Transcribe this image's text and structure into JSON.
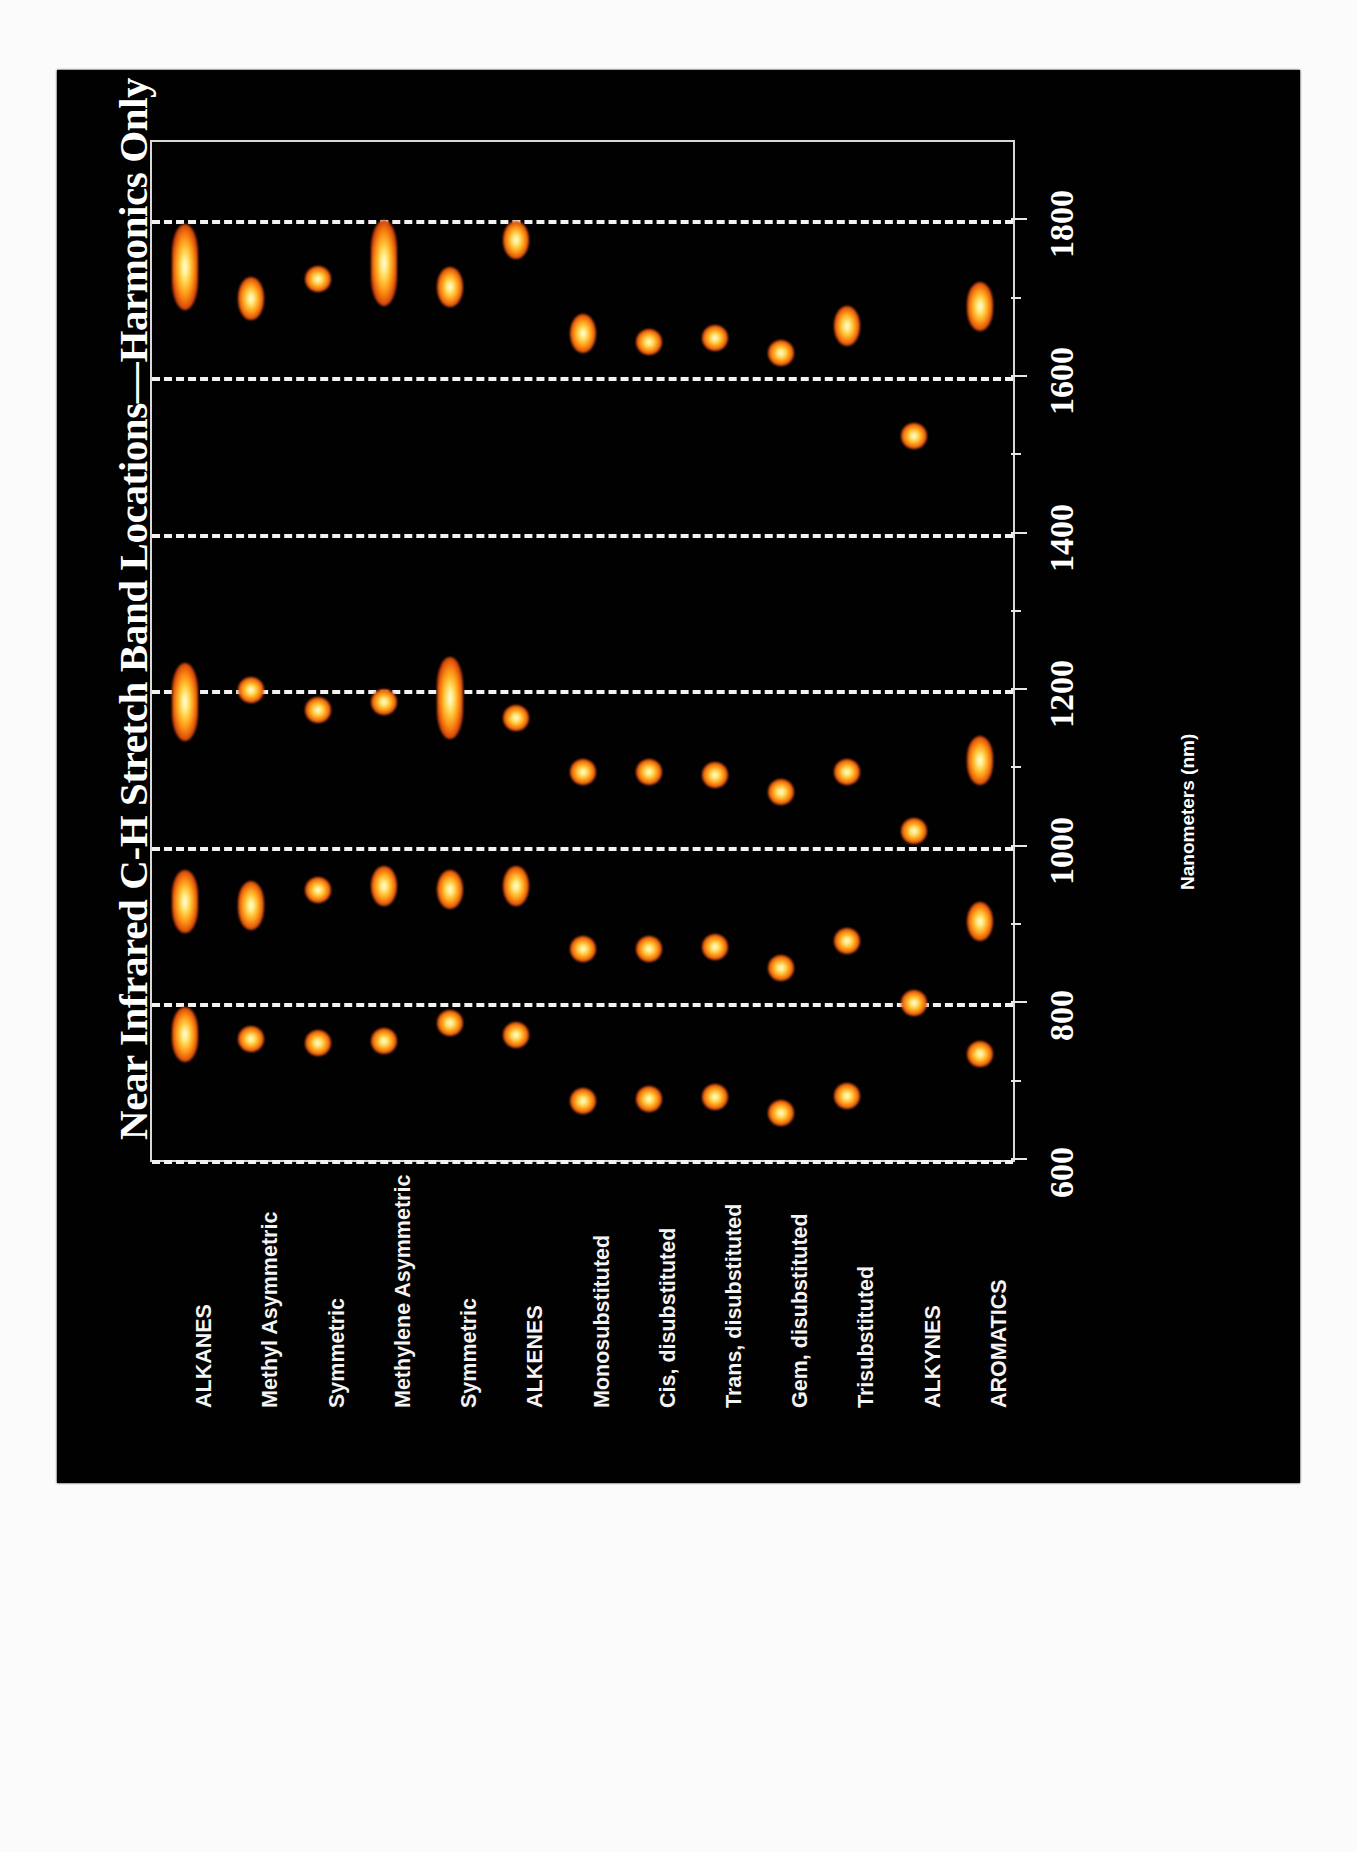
{
  "figure": {
    "title": "Near Infrared C-H Stretch Band Locations—Harmonics Only",
    "axis_title": "Nanometers (nm)",
    "background_color": "#000000",
    "spot_color": "#ff9b18",
    "grid_color": "#f2f2f2"
  },
  "chart_data": {
    "type": "scatter",
    "title": "Near Infrared C-H Stretch Band Locations—Harmonics Only",
    "xlabel": "Nanometers (nm)",
    "ylabel": "",
    "xlim": [
      600,
      1900
    ],
    "ticks": [
      600,
      800,
      1000,
      1200,
      1400,
      1600,
      1800
    ],
    "grid": true,
    "legend": "none",
    "orientation": "categories-vertical-axis-horizontal",
    "categories": [
      "ALKANES",
      "Methyl Asymmetric",
      "Symmetric",
      "Methylene Asymmetric",
      "Symmetric",
      "ALKENES",
      "Monosubstituted",
      "Cis, disubstituted",
      "Trans, disubstituted",
      "Gem, disubstituted",
      "Trisubstituted",
      "ALKYNES",
      "AROMATICS"
    ],
    "series": [
      {
        "name": "ALKANES",
        "bands": [
          {
            "center": 1740,
            "width": 110
          },
          {
            "center": 1185,
            "width": 100
          },
          {
            "center": 930,
            "width": 80
          },
          {
            "center": 760,
            "width": 70
          }
        ]
      },
      {
        "name": "Methyl Asymmetric",
        "bands": [
          {
            "center": 1700,
            "width": 55
          },
          {
            "center": 1200,
            "width": 30
          },
          {
            "center": 925,
            "width": 62
          },
          {
            "center": 755,
            "width": 30
          }
        ]
      },
      {
        "name": "Symmetric",
        "bands": [
          {
            "center": 1725,
            "width": 28
          },
          {
            "center": 1175,
            "width": 28
          },
          {
            "center": 945,
            "width": 30
          },
          {
            "center": 750,
            "width": 28
          }
        ]
      },
      {
        "name": "Methylene Asymmetric",
        "bands": [
          {
            "center": 1745,
            "width": 110
          },
          {
            "center": 1185,
            "width": 30
          },
          {
            "center": 950,
            "width": 52
          },
          {
            "center": 752,
            "width": 28
          }
        ]
      },
      {
        "name": "Symmetric",
        "bands": [
          {
            "center": 1715,
            "width": 52
          },
          {
            "center": 1190,
            "width": 105
          },
          {
            "center": 945,
            "width": 50
          },
          {
            "center": 775,
            "width": 28
          }
        ]
      },
      {
        "name": "ALKENES",
        "bands": [
          {
            "center": 1775,
            "width": 48
          },
          {
            "center": 1165,
            "width": 30
          },
          {
            "center": 950,
            "width": 52
          },
          {
            "center": 760,
            "width": 30
          }
        ]
      },
      {
        "name": "Monosubstituted",
        "bands": [
          {
            "center": 1655,
            "width": 50
          },
          {
            "center": 1095,
            "width": 30
          },
          {
            "center": 870,
            "width": 30
          },
          {
            "center": 675,
            "width": 30
          }
        ]
      },
      {
        "name": "Cis, disubstituted",
        "bands": [
          {
            "center": 1645,
            "width": 30
          },
          {
            "center": 1095,
            "width": 30
          },
          {
            "center": 870,
            "width": 30
          },
          {
            "center": 678,
            "width": 30
          }
        ]
      },
      {
        "name": "Trans, disubstituted",
        "bands": [
          {
            "center": 1650,
            "width": 30
          },
          {
            "center": 1092,
            "width": 30
          },
          {
            "center": 872,
            "width": 30
          },
          {
            "center": 680,
            "width": 30
          }
        ]
      },
      {
        "name": "Gem, disubstituted",
        "bands": [
          {
            "center": 1630,
            "width": 28
          },
          {
            "center": 1070,
            "width": 30
          },
          {
            "center": 845,
            "width": 30
          },
          {
            "center": 660,
            "width": 30
          }
        ]
      },
      {
        "name": "Trisubstituted",
        "bands": [
          {
            "center": 1665,
            "width": 50
          },
          {
            "center": 1095,
            "width": 30
          },
          {
            "center": 880,
            "width": 30
          },
          {
            "center": 682,
            "width": 30
          }
        ]
      },
      {
        "name": "ALKYNES",
        "bands": [
          {
            "center": 1525,
            "width": 30
          },
          {
            "center": 1020,
            "width": 30
          },
          {
            "center": 800,
            "width": 30
          }
        ]
      },
      {
        "name": "AROMATICS",
        "bands": [
          {
            "center": 1690,
            "width": 62
          },
          {
            "center": 1110,
            "width": 62
          },
          {
            "center": 905,
            "width": 50
          },
          {
            "center": 735,
            "width": 32
          }
        ]
      }
    ]
  }
}
